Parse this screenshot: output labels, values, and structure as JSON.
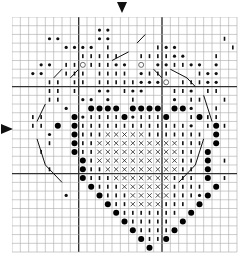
{
  "chart": {
    "type": "cross-stitch-pattern",
    "cols": 27,
    "rows": 27,
    "major_every": 10,
    "major_lines_cols": [
      8,
      18
    ],
    "major_lines_rows": [
      8,
      18
    ],
    "center_markers": {
      "top": "down-arrow-at-center-column",
      "left": "right-arrow-at-center-row"
    },
    "legend": {
      "*": "small-dot-pair",
      "i": "tick-stitch",
      "o": "hollow-circle",
      "B": "large-filled-dot",
      "x": "cross-stitch"
    },
    "grid": [
      "...........................",
      "..........**...............",
      "....**....**.............i.",
      "......****.i.....i**......i",
      "........iiiii..iiii**...i..",
      "...**.iioiii**.o.**ii**.*..",
      "..**..iii.iiii.*iii...i**..",
      "....ii.ii.iiiii***o.iii**..",
      "....ii.i..**.i**...ii*.ii..",
      "....ii..**.*..i....*.ii..i.",
      "......*..BBBB.BBBB.BB*..i..",
      "..ii...B*iiiiB*iiiB..iBii..",
      "..ii.B.Biiiiiiiiiiiii*.iBi.",
      "....*..Biiixxxxxiiiiiii.B..",
      "....i..Biixxxxxxxxxxiii.B..",
      "...i...Biixxxxxxxxxxii.B...",
      "........Bixxxxxxxxxxii.B.i.",
      "....i...Biixxxxxxxxxii.B...",
      "........Biiixxxxxxxiii.B.i.",
      ".........Biiixxxxxxiiii.B..",
      "......*...Biiixxxxxiii*B...",
      "...........Biixxxxiii.B....",
      "............Biiiiiii.B.....",
      ".............Biiiii.B......",
      "..............BiiiiB.......",
      "...............BiiB........",
      "................B.........."
    ],
    "backstitch_lines": [
      [
        [
          12,
          5
        ],
        [
          14,
          4
        ]
      ],
      [
        [
          5,
          7
        ],
        [
          6,
          6
        ]
      ],
      [
        [
          7,
          7
        ],
        [
          8,
          6
        ]
      ],
      [
        [
          15,
          3
        ],
        [
          16,
          2
        ]
      ],
      [
        [
          17,
          6
        ],
        [
          18,
          7
        ]
      ],
      [
        [
          19,
          6
        ],
        [
          21,
          7
        ]
      ],
      [
        [
          21,
          7
        ],
        [
          22,
          8
        ]
      ],
      [
        [
          3,
          12
        ],
        [
          4,
          10
        ]
      ],
      [
        [
          23,
          9
        ],
        [
          24,
          12
        ]
      ],
      [
        [
          3,
          14
        ],
        [
          4,
          17
        ]
      ],
      [
        [
          4,
          17
        ],
        [
          6,
          19
        ]
      ],
      [
        [
          23,
          14
        ],
        [
          22,
          17
        ]
      ],
      [
        [
          22,
          17
        ],
        [
          20,
          19
        ]
      ]
    ]
  }
}
